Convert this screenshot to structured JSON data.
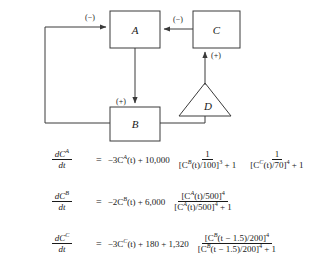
{
  "figure": {
    "name": "block-diagram-with-differential-equations",
    "diagram": {
      "nodes": [
        {
          "id": "A",
          "shape": "rectangle",
          "label": "A"
        },
        {
          "id": "B",
          "shape": "rectangle",
          "label": "B"
        },
        {
          "id": "C",
          "shape": "rectangle",
          "label": "C"
        },
        {
          "id": "D",
          "shape": "triangle",
          "label": "D"
        }
      ],
      "edges": [
        {
          "from": "B",
          "to": "A",
          "sign_label": "(−)",
          "route": "left-feedback"
        },
        {
          "from": "C",
          "to": "A",
          "sign_label": "(−)",
          "route": "horizontal"
        },
        {
          "from": "A",
          "to": "B",
          "sign_label": "(+)",
          "route": "vertical"
        },
        {
          "from": "D",
          "to": "C",
          "sign_label": "(+)",
          "route": "vertical"
        },
        {
          "from": "B",
          "to": "D",
          "sign_label": "",
          "route": "base"
        }
      ],
      "line_color": "#3a3a3a"
    },
    "equations": [
      {
        "id": "eq-dCA-dt",
        "lhs_num": "dC",
        "lhs_num_sub": "A",
        "lhs_den": "dt",
        "equals": "=",
        "linear": "−3C",
        "linear_sub": "A",
        "linear_rest": "(t) + 10,000",
        "fractions": [
          {
            "num": "1",
            "den_pre": "[C",
            "den_sub": "B",
            "den_mid": "(t)/100]",
            "den_exp": "3",
            "den_post": " + 1"
          },
          {
            "num": "1",
            "den_pre": "[C",
            "den_sub": "C",
            "den_mid": "(t)/70]",
            "den_exp": "4",
            "den_post": " + 1"
          }
        ]
      },
      {
        "id": "eq-dCB-dt",
        "lhs_num": "dC",
        "lhs_num_sub": "B",
        "lhs_den": "dt",
        "equals": "=",
        "linear": "−2C",
        "linear_sub": "B",
        "linear_rest": "(t) + 6,000",
        "fractions": [
          {
            "num_pre": "[C",
            "num_sub": "A",
            "num_mid": "(t)/500]",
            "num_exp": "4",
            "num_post": "",
            "den_pre": "[C",
            "den_sub": "A",
            "den_mid": "(t)/500]",
            "den_exp": "4",
            "den_post": " + 1"
          }
        ]
      },
      {
        "id": "eq-dCC-dt",
        "lhs_num": "dC",
        "lhs_num_sub": "C",
        "lhs_den": "dt",
        "equals": "=",
        "linear": "−3C",
        "linear_sub": "C",
        "linear_rest": "(t) + 180 + 1,320",
        "fractions": [
          {
            "num_pre": "[C",
            "num_sub": "B",
            "num_mid": "(t − 1.5)/200]",
            "num_exp": "4",
            "num_post": "",
            "den_pre": "[C",
            "den_sub": "B",
            "den_mid": "(t − 1.5)/200]",
            "den_exp": "4",
            "den_post": " + 1"
          }
        ]
      }
    ]
  }
}
